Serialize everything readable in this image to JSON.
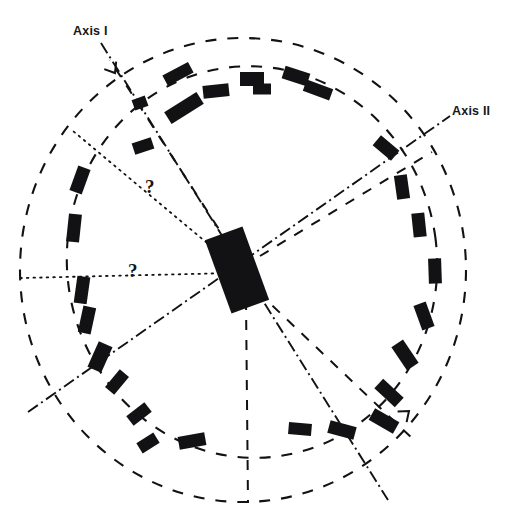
{
  "figure": {
    "background_color": "#ffffff",
    "ink_color": "#121214",
    "width": 506,
    "height": 528
  },
  "labels": {
    "axis_1": "Axis I",
    "axis_2": "Axis II",
    "question_1": "?",
    "question_2": "?"
  },
  "chart_data": {
    "type": "scatter",
    "xlabel": "",
    "ylabel": "",
    "xlim": [
      0,
      506
    ],
    "ylim": [
      0,
      528
    ],
    "grid": false,
    "legend": null,
    "center": {
      "x": 237,
      "y": 270
    },
    "center_marker": {
      "name": "central-block",
      "x": 237,
      "y": 270,
      "w": 40,
      "h": 78,
      "angle": -20
    },
    "dashed_circles": [
      {
        "name": "outer-dashed-circle",
        "cx": 243,
        "cy": 270,
        "rx": 223,
        "ry": 232,
        "rotate": 0,
        "dash": "11 11",
        "width": 2.1
      },
      {
        "name": "inner-dashed-circle",
        "cx": 252,
        "cy": 262,
        "rx": 185,
        "ry": 196,
        "rotate": -8,
        "dash": "11 11",
        "width": 2.1
      }
    ],
    "axes": [
      {
        "name": "axis-1",
        "label": "Axis I",
        "style": "dash-dot",
        "x1": 101,
        "y1": 43,
        "x2": 388,
        "y2": 500
      },
      {
        "name": "axis-2",
        "label": "Axis II",
        "style": "dash-dot",
        "x1": 28,
        "y1": 412,
        "x2": 450,
        "y2": 116
      }
    ],
    "dotted_rays": [
      {
        "name": "dotted-ray-upper-left",
        "x1": 237,
        "y1": 268,
        "x2": 73,
        "y2": 131,
        "label": "?"
      },
      {
        "name": "dotted-ray-left",
        "x1": 233,
        "y1": 273,
        "x2": 21,
        "y2": 278,
        "label": "?"
      }
    ],
    "dashed_rays": [
      {
        "name": "dashed-ray-up",
        "x1": 240,
        "y1": 262,
        "x2": 110,
        "y2": 60
      },
      {
        "name": "dashed-ray-down",
        "x1": 246,
        "y1": 300,
        "x2": 248,
        "y2": 503
      },
      {
        "name": "dashed-ray-lower-right",
        "x1": 258,
        "y1": 292,
        "x2": 414,
        "y2": 440
      },
      {
        "name": "dashed-ray-upper-right",
        "x1": 260,
        "y1": 256,
        "x2": 432,
        "y2": 152
      }
    ],
    "angle_ticks": [
      {
        "name": "angle-tick-top-left",
        "x": 115,
        "y": 73,
        "angle": 58
      },
      {
        "name": "angle-tick-bottom-right",
        "x": 409,
        "y": 411,
        "angle": -40
      }
    ],
    "series": [
      {
        "name": "oriented-grains",
        "description": "black rectangular grains arranged around a ring, each with position and orientation",
        "points": [
          {
            "x": 184,
            "y": 108,
            "w": 14,
            "h": 38,
            "angle": 58
          },
          {
            "x": 143,
            "y": 146,
            "w": 12,
            "h": 20,
            "angle": 72
          },
          {
            "x": 140,
            "y": 103,
            "w": 11,
            "h": 14,
            "angle": 70
          },
          {
            "x": 178,
            "y": 74,
            "w": 12,
            "h": 29,
            "angle": 62
          },
          {
            "x": 216,
            "y": 91,
            "w": 13,
            "h": 26,
            "angle": 84
          },
          {
            "x": 252,
            "y": 79,
            "w": 14,
            "h": 24,
            "angle": 90
          },
          {
            "x": 262,
            "y": 89,
            "w": 11,
            "h": 18,
            "angle": 90
          },
          {
            "x": 296,
            "y": 76,
            "w": 13,
            "h": 26,
            "angle": 108
          },
          {
            "x": 318,
            "y": 90,
            "w": 12,
            "h": 28,
            "angle": 110
          },
          {
            "x": 386,
            "y": 148,
            "w": 13,
            "h": 24,
            "angle": 130
          },
          {
            "x": 402,
            "y": 187,
            "w": 13,
            "h": 24,
            "angle": 172
          },
          {
            "x": 419,
            "y": 225,
            "w": 13,
            "h": 24,
            "angle": 174
          },
          {
            "x": 435,
            "y": 271,
            "w": 13,
            "h": 25,
            "angle": 178
          },
          {
            "x": 424,
            "y": 316,
            "w": 13,
            "h": 26,
            "angle": 160
          },
          {
            "x": 405,
            "y": 355,
            "w": 14,
            "h": 28,
            "angle": 146
          },
          {
            "x": 389,
            "y": 393,
            "w": 13,
            "h": 28,
            "angle": 133
          },
          {
            "x": 384,
            "y": 421,
            "w": 13,
            "h": 28,
            "angle": 120
          },
          {
            "x": 342,
            "y": 430,
            "w": 13,
            "h": 27,
            "angle": 105
          },
          {
            "x": 300,
            "y": 429,
            "w": 12,
            "h": 23,
            "angle": 95
          },
          {
            "x": 192,
            "y": 441,
            "w": 13,
            "h": 27,
            "angle": 80
          },
          {
            "x": 148,
            "y": 443,
            "w": 12,
            "h": 20,
            "angle": 58
          },
          {
            "x": 139,
            "y": 414,
            "w": 12,
            "h": 23,
            "angle": 52
          },
          {
            "x": 117,
            "y": 382,
            "w": 12,
            "h": 23,
            "angle": 40
          },
          {
            "x": 100,
            "y": 357,
            "w": 15,
            "h": 28,
            "angle": 24
          },
          {
            "x": 87,
            "y": 320,
            "w": 13,
            "h": 27,
            "angle": 12
          },
          {
            "x": 82,
            "y": 290,
            "w": 13,
            "h": 27,
            "angle": 8
          },
          {
            "x": 74,
            "y": 228,
            "w": 13,
            "h": 28,
            "angle": 6
          },
          {
            "x": 80,
            "y": 180,
            "w": 13,
            "h": 26,
            "angle": 20
          }
        ]
      }
    ]
  }
}
